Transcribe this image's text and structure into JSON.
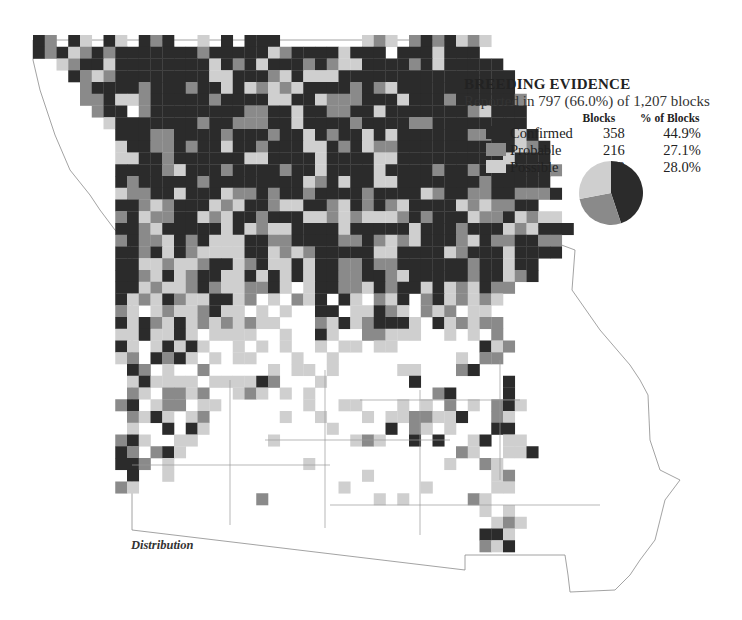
{
  "legend": {
    "title": "BREEDING EVIDENCE",
    "subtitle": "Reported in 797 (66.0%) of 1,207 blocks",
    "col_blocks": "Blocks",
    "col_pct": "% of Blocks",
    "rows": [
      {
        "label": "Confirmed",
        "blocks": "358",
        "pct": "44.9%",
        "color": "#2b2b2b"
      },
      {
        "label": "Probable",
        "blocks": "216",
        "pct": "27.1%",
        "color": "#8a8a8a"
      },
      {
        "label": "Possible",
        "blocks": "223",
        "pct": "28.0%",
        "color": "#cfcfcf"
      }
    ]
  },
  "caption": "Distribution",
  "colors": {
    "confirmed": "#2b2b2b",
    "probable": "#8a8a8a",
    "possible": "#cfcfcf",
    "border": "#8c8c8c"
  },
  "chart_data": {
    "type": "pie",
    "title": "BREEDING EVIDENCE",
    "categories": [
      "Confirmed",
      "Probable",
      "Possible"
    ],
    "values": [
      44.9,
      27.1,
      28.0
    ],
    "blocks": [
      358,
      216,
      223
    ],
    "reported_blocks": 797,
    "total_blocks": 1207,
    "reported_pct": 66.0
  },
  "grid": {
    "x0": 33,
    "y0": 35,
    "cell": 11.75,
    "rows": [
      "CP.CS.CS.CPC..S.C.CCC.......SPS.PCPCSPS",
      "CPCSPCPCCCCCCCPCCCCCSPCCCCSCCC.CCCSCCC",
      "  SPCCSCCCCCCCCSCPCSCCCPCPSSCCCCPCSCCCCC",
      "   CPSPCCCCCCCCSSCCCPSCSSSCCCCCCCCCCCCCCC",
      "    PCCCCPCCCPCCSCSPSPSCCCCPCPSCCCCCCCCCC",
      "    PPCSSPCCCCCPCCCCSSCCSPPPCCCSCCCPCCCCCP",
      "     PCC.PCCCCCCCCPPCCSCCPPCCSCCCCCCCPSCCC",
      "      SCCCCCCCPCCPPPCCSCCCCPCCCCPPCCCCCCCC",
      "       CCCPPCCCCPCCCPCCSCPCCSCSCCCCCCPPCCSC",
      "       SCCPPCPCCSCCPCCCSSCPCSPPCCCCCCCCCCSPC",
      "       SSCCPCCCCCCSSCCCCSCCCCSSCCCCCCCCCSCCC",
      "       CCCCPSCCCPCCCCPCCSCCCCSCCCCPCCPCCCCCCP",
      "       CPCCCCCPCCCCCCCCSPCSCCSSCCCCCCCPCCCCC",
      "       SPPCCSCCCSPPCPCCPCCCCPCCCCSPCCPPCCPPPC",
      "       CCPSPCCCSPSCCPSSCCPSCPCPSCCCCSPSPPCC",
      "       PCSPPCCSPSCCPCCCSSPSPSSSPCPCCCSPPCSPSS",
      "       CCPSCCCCCSCSPSSCCCCSCCCCCSCCCPCCCSPSCCC",
      "       PCPPSCPCSSSCCPPCCCCPPCPSPSCCCPSCPPCCPP",
      "       CCPCSCPSSSSCCSPSPCCCCCSSCCCCSPCCCSCCCC",
      "       CCSSPSSPCCSPCSSCSCCPPCPPCCCCCCPCCSCC",
      "       CCPSCSPCCSSCSCSCSCCPPCCPSCCCCCPCCSPC",
      "       CCSPSSPCPSSPPCS.SCCPPSCPCCSCSPSCPP",
      "       CSPSCPSSCCSP.S.PSC.CS.PSC.PCSPSPS",
      "       PS.SPSSPCSS.S.S..CC.SSCPS.PSP.SS",
      "       CSCPSCSPSPSPSS...PSCSPCCCS.CSPSPP",
      "       SSCSSCS.SSSS..S..CS..PPSSS..S.S.P.",
      "       CS.SCSCS..S.S.S..S.SS.SS.......CSP",
      "       SP.CPCS.S.SS...S..S..........S.PP",
      "       .CP.S..P.....S.SS.S.....SS...PC.",
      "       .SCSSSS.SSSSCP...S.......C.......C",
      "       .PS.PPSP..SPS.S.S..........PC....C",
      "       PC.SPP.SS.......S..SS...S.S.P.S.PCS",
      "       .PSCS.SP......S..S...S.SSPPSSC..PS",
      "       .S..C.CS..........S....C.PS.S...CC",
      "       PCS..SS......S......SPS..C.C..SC.SS",
      "       CP.PCS.......................PS..SSC",
      "       CCP.S...........S...........S..PS",
      "       .C..S................S..........SP",
      "       PS.................S......S.....SS",
      "       ............P.........S.S.....PS.",
      "                                      S.S",
      "                                       SPS",
      "                                      CCS.",
      "                                      PSC."
    ]
  }
}
